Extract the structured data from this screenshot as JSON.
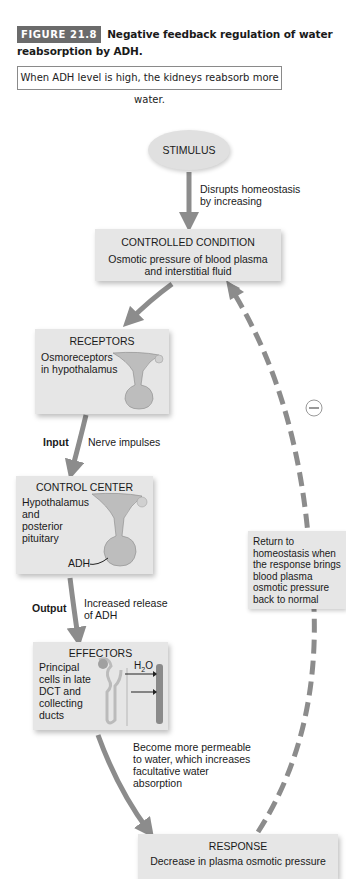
{
  "figure": {
    "badge": "FIGURE 21.8",
    "title": "Negative feedback regulation of water reabsorption by ADH.",
    "note": "When ADH level is high, the kidneys reabsorb more water."
  },
  "diagram": {
    "stimulus": {
      "label": "STIMULUS"
    },
    "stimulus_arrow_label": [
      "Disrupts homeostasis",
      "by increasing"
    ],
    "controlled_condition": {
      "title": "CONTROLLED CONDITION",
      "text": [
        "Osmotic pressure of blood plasma",
        "and interstitial fluid"
      ]
    },
    "receptors": {
      "title": "RECEPTORS",
      "text": [
        "Osmoreceptors",
        "in hypothalamus"
      ]
    },
    "input": {
      "label": "Input",
      "description": "Nerve impulses"
    },
    "control_center": {
      "title": "CONTROL CENTER",
      "text": [
        "Hypothalamus",
        "and",
        "posterior",
        "pituitary"
      ],
      "hormone_label": "ADH"
    },
    "output": {
      "label": "Output",
      "description": [
        "Increased release",
        "of ADH"
      ]
    },
    "effectors": {
      "title": "EFFECTORS",
      "text": [
        "Principal",
        "cells in late",
        "DCT and",
        "collecting",
        "ducts"
      ],
      "water_label": "H",
      "water_sub": "2",
      "water_suffix": "O"
    },
    "effector_arrow_label": [
      "Become more permeable",
      "to water, which increases",
      "facultative water",
      "absorption"
    ],
    "response": {
      "title": "RESPONSE",
      "text": "Decrease in plasma osmotic pressure"
    },
    "feedback": {
      "sign": "−",
      "text": [
        "Return to",
        "homeostasis when",
        "the response brings",
        "blood plasma",
        "osmotic pressure",
        "back to normal"
      ]
    }
  },
  "colors": {
    "arrow": "#8c8c8c",
    "box": "#e6e6e6",
    "badge": "#6b6b6b"
  }
}
